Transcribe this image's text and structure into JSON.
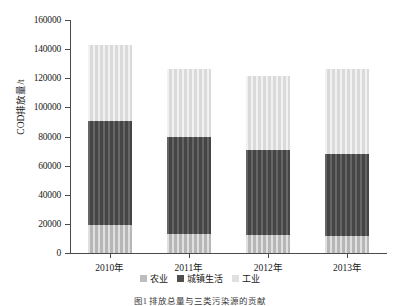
{
  "chart_data": {
    "type": "bar",
    "subtype": "stacked-bar",
    "title": "",
    "xlabel": "",
    "ylabel": "COD排放量/t",
    "ylim": [
      0,
      160000
    ],
    "ytick_step": 20000,
    "yticks": [
      "160000",
      "140000",
      "120000",
      "100000",
      "80000",
      "60000",
      "40000",
      "20000",
      "0"
    ],
    "grid": false,
    "legend_position": "bottom",
    "categories": [
      "2010年",
      "2011年",
      "2012年",
      "2013年"
    ],
    "series": [
      {
        "name": "农业",
        "color": "#bdbdbd",
        "values": [
          19000,
          13000,
          12500,
          12000
        ]
      },
      {
        "name": "城镇生活",
        "color": "#4e4e4e",
        "values": [
          72000,
          67000,
          58500,
          56000
        ]
      },
      {
        "name": "工业",
        "color": "#e0e0e0",
        "values": [
          52000,
          46500,
          50500,
          58500
        ]
      }
    ],
    "totals": [
      143000,
      126500,
      121500,
      126500
    ],
    "stack_order_bottom_to_top": [
      "农业",
      "城镇生活",
      "工业"
    ]
  },
  "caption": {
    "text": "图1  排放总量与三类污染源的贡献"
  }
}
